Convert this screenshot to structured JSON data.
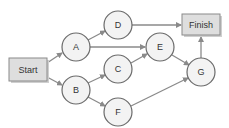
{
  "diagram": {
    "type": "network-activity-diagram",
    "colors": {
      "edge": "#8a8a8a",
      "circle_fill": "#f3f3f3",
      "circle_stroke": "#6a6a6a",
      "box_fill": "#dedede"
    },
    "nodes": {
      "start": {
        "label": "Start",
        "shape": "box"
      },
      "finish": {
        "label": "Finish",
        "shape": "box"
      },
      "a": {
        "label": "A",
        "shape": "circle"
      },
      "b": {
        "label": "B",
        "shape": "circle"
      },
      "c": {
        "label": "C",
        "shape": "circle"
      },
      "d": {
        "label": "D",
        "shape": "circle"
      },
      "e": {
        "label": "E",
        "shape": "circle"
      },
      "f": {
        "label": "F",
        "shape": "circle"
      },
      "g": {
        "label": "G",
        "shape": "circle"
      }
    },
    "edges": [
      [
        "Start",
        "A"
      ],
      [
        "Start",
        "B"
      ],
      [
        "A",
        "D"
      ],
      [
        "A",
        "E"
      ],
      [
        "B",
        "C"
      ],
      [
        "B",
        "F"
      ],
      [
        "C",
        "E"
      ],
      [
        "D",
        "Finish"
      ],
      [
        "E",
        "G"
      ],
      [
        "F",
        "G"
      ],
      [
        "G",
        "Finish"
      ]
    ]
  }
}
